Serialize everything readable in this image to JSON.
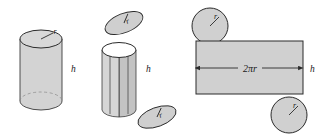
{
  "figure": {
    "colors": {
      "fill_light": "#d3d3d3",
      "fill_mid": "#c8c8c8",
      "fill_dark": "#bdbdbd",
      "fill_white": "#ffffff",
      "stroke": "#3a3a3a",
      "background": "#ffffff"
    },
    "panels": [
      {
        "name": "solid-cylinder",
        "labels": {
          "radius": "r",
          "height": "h"
        }
      },
      {
        "name": "exploded-cylinder",
        "labels": {
          "radius_top": "r",
          "radius_bottom": "r",
          "height": "h"
        }
      },
      {
        "name": "flat-net",
        "labels": {
          "circumference": "2πr",
          "height": "h",
          "radius_top": "r",
          "radius_bottom": "r"
        }
      }
    ]
  }
}
